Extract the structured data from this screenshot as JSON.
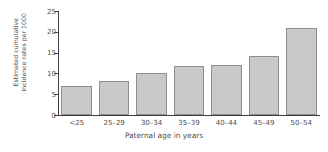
{
  "chart_data": {
    "type": "bar",
    "title": "",
    "categories": [
      "<25",
      "25–29",
      "30–34",
      "35–39",
      "40–44",
      "45–49",
      "50–54"
    ],
    "values": [
      7.0,
      8.2,
      10.2,
      11.7,
      12.0,
      14.3,
      21.0
    ],
    "xlabel": "Paternal age in years",
    "ylabel": "Estimated cumulative incidence rates per 1000",
    "ylabel_lines": [
      "Estimated cumulative",
      "incidence rates per 1000"
    ],
    "ylim": [
      0,
      25
    ],
    "yticks": [
      0,
      5,
      10,
      15,
      20,
      25
    ],
    "ytick_labels": [
      "0",
      "5",
      "10",
      "15",
      "20",
      "25"
    ],
    "grid": false,
    "legend": null,
    "bar_fill_color": "#c9c9c9",
    "bar_edge_color": "#8e8e8e",
    "axis_color": "#3d3d3d",
    "text_color": "#4f4f4f"
  }
}
